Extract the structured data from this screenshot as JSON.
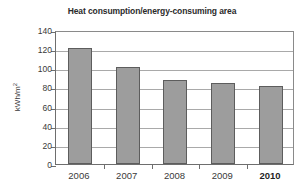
{
  "chart_data": {
    "type": "bar",
    "title": "Heat consumption/energy-consuming area",
    "xlabel": "",
    "ylabel": "kWh/m²",
    "ylabel_base": "kWh/m",
    "ylabel_exponent": "2",
    "categories": [
      "2006",
      "2007",
      "2008",
      "2009",
      "2010"
    ],
    "values": [
      121.5,
      101,
      87.5,
      84.5,
      82
    ],
    "ylim": [
      0,
      140
    ],
    "ytick_values": [
      0,
      20,
      40,
      60,
      80,
      100,
      120,
      140
    ],
    "ytick_labels": [
      "0",
      "20",
      "40",
      "60",
      "80",
      "100",
      "120",
      "140"
    ],
    "grid": "horizontal",
    "legend": "none",
    "bar_color": "#9d9d9d",
    "bar_border_color": "#5d5d5d",
    "gridline_color": "#a9a9a9",
    "axis_color": "#6e6e6e",
    "background_color": "#ffffff",
    "emphasized_category": "2010"
  }
}
